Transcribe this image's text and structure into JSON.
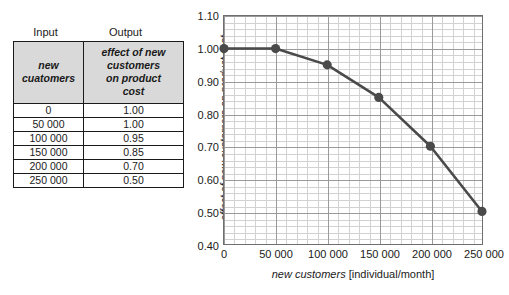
{
  "table": {
    "column_group_labels": [
      "Input",
      "Output"
    ],
    "headers": [
      [
        "new",
        "cuatomers"
      ],
      [
        "effect of new",
        "customers",
        "on product",
        "cost"
      ]
    ],
    "rows": [
      [
        "0",
        "1.00"
      ],
      [
        "50 000",
        "1.00"
      ],
      [
        "100 000",
        "0.95"
      ],
      [
        "150 000",
        "0.85"
      ],
      [
        "200 000",
        "0.70"
      ],
      [
        "250 000",
        "0.50"
      ]
    ],
    "header_fill": "#d9d9d9",
    "border_color": "#1a1a1a"
  },
  "chart_data": {
    "type": "line",
    "title": "",
    "xlabel_italic": "new customers",
    "xlabel_unit": "[individual/month]",
    "ylabel_line1": "effect of new customers on product cost",
    "ylabel_line2": "[dimensionless]",
    "x": [
      0,
      50000,
      100000,
      150000,
      200000,
      250000
    ],
    "values": [
      1.0,
      1.0,
      0.95,
      0.85,
      0.7,
      0.5
    ],
    "xlim": [
      0,
      250000
    ],
    "ylim": [
      0.4,
      1.1
    ],
    "xticks": [
      0,
      50000,
      100000,
      150000,
      200000,
      250000
    ],
    "xticklabels": [
      "0",
      "50 000",
      "100 000",
      "150 000",
      "200 000",
      "250 000"
    ],
    "yticks": [
      0.4,
      0.5,
      0.6,
      0.7,
      0.8,
      0.9,
      1.0,
      1.1
    ],
    "yticklabels": [
      "0.40",
      "0.50",
      "0.60",
      "0.70",
      "0.80",
      "0.90",
      "1.00",
      "1.10"
    ],
    "grid": true,
    "minor_grid": true,
    "minor_divisions_x": 5,
    "minor_divisions_y": 5,
    "legend": "none",
    "series_color": "#4a4a4a",
    "marker": "circle",
    "grid_major_color": "#9a9a9a",
    "grid_minor_color": "#d2d2d2"
  }
}
